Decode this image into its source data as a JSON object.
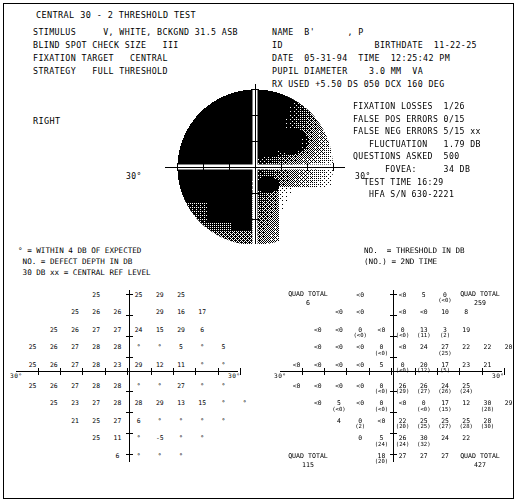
{
  "header": {
    "title": "CENTRAL 30 - 2 THRESHOLD TEST",
    "left_rows": [
      "STIMULUS     V, WHITE, BCKGND 31.5 ASB",
      "BLIND SPOT CHECK SIZE   III",
      "FIXATION TARGET   CENTRAL",
      "STRATEGY   FULL THRESHOLD"
    ],
    "right_rows": [
      "NAME  B'      , P",
      "ID                 BIRTHDATE  11-22-25",
      "DATE  05-31-94  TIME  12:25:42 PM",
      "PUPIL DIAMETER    3.0 MM  VA",
      "RX USED +5.50 DS 050 DCX 160 DEG"
    ]
  },
  "eye_label": "RIGHT",
  "reliability": [
    "FIXATION LOSSES  1/26",
    "FALSE POS ERRORS 0/15",
    "FALSE NEG ERRORS 5/15 xx",
    "   FLUCTUATION   1.79 DB",
    "QUESTIONS ASKED  500",
    "      FOVEA:     34 DB",
    "  TEST TIME 16:29",
    "   HFA S/N 630-2221"
  ],
  "map": {
    "left_deg_label": "30°",
    "right_deg_label": "30°"
  },
  "legend": {
    "left": "° = WITHIN 4 DB OF EXPECTED\n NO. = DEFECT DEPTH IN DB\n 30 DB xx = CENTRAL REF LEVEL",
    "right": "NO.  = THRESHOLD IN DB\n(NO.) = 2ND TIME"
  },
  "defect_grid": {
    "deg_left": "30°",
    "deg_right": "30°",
    "quad_totals": {
      "top_left_label": "QUAD TOTAL",
      "top_left_value": "",
      "top_right_label": "",
      "top_right_value": "",
      "bottom_left_label": "",
      "bottom_left_value": "",
      "bottom_right_label": "",
      "bottom_right_value": ""
    },
    "rows": [
      {
        "y": 0,
        "cells": [
          {
            "x": 3,
            "v": "25"
          },
          {
            "x": 5,
            "v": "25"
          },
          {
            "x": 6,
            "v": "29"
          },
          {
            "x": 7,
            "v": "25"
          }
        ]
      },
      {
        "y": 1,
        "cells": [
          {
            "x": 2,
            "v": "25"
          },
          {
            "x": 3,
            "v": "26"
          },
          {
            "x": 4,
            "v": "26"
          },
          {
            "x": 6,
            "v": "29"
          },
          {
            "x": 7,
            "v": "16"
          },
          {
            "x": 8,
            "v": "17"
          }
        ]
      },
      {
        "y": 2,
        "cells": [
          {
            "x": 1,
            "v": "25"
          },
          {
            "x": 2,
            "v": "26"
          },
          {
            "x": 3,
            "v": "27"
          },
          {
            "x": 4,
            "v": "27"
          },
          {
            "x": 5,
            "v": "24"
          },
          {
            "x": 6,
            "v": "15"
          },
          {
            "x": 7,
            "v": "29"
          },
          {
            "x": 8,
            "v": "6"
          }
        ]
      },
      {
        "y": 3,
        "cells": [
          {
            "x": 0,
            "v": "25"
          },
          {
            "x": 1,
            "v": "26"
          },
          {
            "x": 2,
            "v": "27"
          },
          {
            "x": 3,
            "v": "28"
          },
          {
            "x": 4,
            "v": "28"
          },
          {
            "x": 5,
            "v": "°"
          },
          {
            "x": 6,
            "v": "°"
          },
          {
            "x": 7,
            "v": "5"
          },
          {
            "x": 8,
            "v": "°"
          },
          {
            "x": 9,
            "v": "5"
          }
        ]
      },
      {
        "y": 4,
        "cells": [
          {
            "x": 0,
            "v": "25"
          },
          {
            "x": 1,
            "v": "26"
          },
          {
            "x": 2,
            "v": "27"
          },
          {
            "x": 3,
            "v": "28"
          },
          {
            "x": 4,
            "v": "23"
          },
          {
            "x": 5,
            "v": "29"
          },
          {
            "x": 6,
            "v": "12"
          },
          {
            "x": 7,
            "v": "11"
          },
          {
            "x": 8,
            "v": "°"
          },
          {
            "x": 9,
            "v": "°"
          }
        ]
      },
      {
        "y": 5,
        "cells": [
          {
            "x": 0,
            "v": "25"
          },
          {
            "x": 1,
            "v": "26"
          },
          {
            "x": 2,
            "v": "27"
          },
          {
            "x": 3,
            "v": "28"
          },
          {
            "x": 4,
            "v": "28"
          },
          {
            "x": 5,
            "v": "°"
          },
          {
            "x": 6,
            "v": "°"
          },
          {
            "x": 7,
            "v": "27"
          },
          {
            "x": 8,
            "v": "°"
          },
          {
            "x": 9,
            "v": "°"
          }
        ]
      },
      {
        "y": 6,
        "cells": [
          {
            "x": 1,
            "v": "25"
          },
          {
            "x": 2,
            "v": "23"
          },
          {
            "x": 3,
            "v": "27"
          },
          {
            "x": 4,
            "v": "28"
          },
          {
            "x": 5,
            "v": "28"
          },
          {
            "x": 6,
            "v": "29"
          },
          {
            "x": 7,
            "v": "13"
          },
          {
            "x": 8,
            "v": "15"
          },
          {
            "x": 9,
            "v": "°"
          },
          {
            "x": 10,
            "v": "°"
          }
        ]
      },
      {
        "y": 7,
        "cells": [
          {
            "x": 2,
            "v": "21"
          },
          {
            "x": 3,
            "v": "25"
          },
          {
            "x": 4,
            "v": "27"
          },
          {
            "x": 5,
            "v": "6"
          },
          {
            "x": 6,
            "v": "°"
          },
          {
            "x": 7,
            "v": "°"
          },
          {
            "x": 8,
            "v": "°"
          },
          {
            "x": 9,
            "v": "°"
          }
        ]
      },
      {
        "y": 8,
        "cells": [
          {
            "x": 3,
            "v": "25"
          },
          {
            "x": 4,
            "v": "11"
          },
          {
            "x": 5,
            "v": "°"
          },
          {
            "x": 6,
            "v": "-5"
          },
          {
            "x": 7,
            "v": "°"
          },
          {
            "x": 8,
            "v": "°"
          }
        ]
      },
      {
        "y": 9,
        "cells": [
          {
            "x": 4,
            "v": "6"
          },
          {
            "x": 5,
            "v": "°"
          },
          {
            "x": 6,
            "v": "°"
          },
          {
            "x": 7,
            "v": "°"
          }
        ]
      }
    ]
  },
  "threshold_grid": {
    "deg_left": "30°",
    "deg_right": "30°",
    "quad_totals": {
      "top_left_label": "QUAD TOTAL",
      "top_left_value": "6",
      "top_right_label": "QUAD TOTAL",
      "top_right_value": "259",
      "bottom_left_label": "QUAD TOTAL",
      "bottom_left_value": "115",
      "bottom_right_label": "QUAD TOTAL",
      "bottom_right_value": "427"
    },
    "rows": [
      {
        "y": 0,
        "cells": [
          {
            "x": 3,
            "v": "<0"
          },
          {
            "x": 5,
            "v": "<0"
          },
          {
            "x": 6,
            "v": "5"
          },
          {
            "x": 7,
            "v": "0",
            "p": "(<0)"
          }
        ]
      },
      {
        "y": 1,
        "cells": [
          {
            "x": 2,
            "v": "<0"
          },
          {
            "x": 3,
            "v": "<0"
          },
          {
            "x": 5,
            "v": "<0"
          },
          {
            "x": 6,
            "v": "<0"
          },
          {
            "x": 7,
            "v": "10"
          },
          {
            "x": 8,
            "v": "8"
          }
        ]
      },
      {
        "y": 2,
        "cells": [
          {
            "x": 1,
            "v": "<0"
          },
          {
            "x": 2,
            "v": "<0"
          },
          {
            "x": 3,
            "v": "0",
            "p": "(<0)"
          },
          {
            "x": 4,
            "v": "<0"
          },
          {
            "x": 5,
            "v": "0",
            "p": "(<0)"
          },
          {
            "x": 6,
            "v": "13",
            "p": "(11)"
          },
          {
            "x": 7,
            "v": "3",
            "p": "(2)"
          },
          {
            "x": 8,
            "v": "19"
          }
        ]
      },
      {
        "y": 3,
        "cells": [
          {
            "x": 1,
            "v": "<0"
          },
          {
            "x": 2,
            "v": "<0"
          },
          {
            "x": 3,
            "v": "<0"
          },
          {
            "x": 4,
            "v": "0",
            "p": "(<0)"
          },
          {
            "x": 5,
            "v": "<0"
          },
          {
            "x": 6,
            "v": "24"
          },
          {
            "x": 7,
            "v": "27",
            "p": "(25)"
          },
          {
            "x": 8,
            "v": "22"
          },
          {
            "x": 9,
            "v": "22"
          },
          {
            "x": 10,
            "v": "20"
          }
        ]
      },
      {
        "y": 4,
        "cells": [
          {
            "x": 0,
            "v": "<0"
          },
          {
            "x": 1,
            "v": "<0"
          },
          {
            "x": 2,
            "v": "<0"
          },
          {
            "x": 3,
            "v": "<0"
          },
          {
            "x": 4,
            "v": "5"
          },
          {
            "x": 5,
            "v": "0",
            "p": "(<0)"
          },
          {
            "x": 6,
            "v": "20",
            "p": "(12)"
          },
          {
            "x": 7,
            "v": "17",
            "p": "(5)"
          },
          {
            "x": 8,
            "v": "23"
          },
          {
            "x": 9,
            "v": "21"
          }
        ]
      },
      {
        "y": 5,
        "cells": [
          {
            "x": 0,
            "v": "<0"
          },
          {
            "x": 1,
            "v": "<0"
          },
          {
            "x": 2,
            "v": "<0"
          },
          {
            "x": 3,
            "v": "<0"
          },
          {
            "x": 4,
            "v": "0",
            "p": "(<0)"
          },
          {
            "x": 5,
            "v": "26",
            "p": "(29)"
          },
          {
            "x": 6,
            "v": "26",
            "p": "(27)"
          },
          {
            "x": 7,
            "v": "24",
            "p": "(26)"
          },
          {
            "x": 8,
            "v": "25",
            "p": "(24)"
          }
        ]
      },
      {
        "y": 6,
        "cells": [
          {
            "x": 1,
            "v": "<0"
          },
          {
            "x": 2,
            "v": "5",
            "p": "(<0)"
          },
          {
            "x": 3,
            "v": "<0"
          },
          {
            "x": 4,
            "v": "0",
            "p": "(<0)"
          },
          {
            "x": 5,
            "v": "<0"
          },
          {
            "x": 6,
            "v": "0",
            "p": "(<0)"
          },
          {
            "x": 7,
            "v": "17",
            "p": "(15)"
          },
          {
            "x": 8,
            "v": "12"
          },
          {
            "x": 9,
            "v": "30",
            "p": "(28)"
          },
          {
            "x": 10,
            "v": "29"
          }
        ]
      },
      {
        "y": 7,
        "cells": [
          {
            "x": 2,
            "v": "4"
          },
          {
            "x": 3,
            "v": "0",
            "p": "(2)"
          },
          {
            "x": 4,
            "v": "<0"
          },
          {
            "x": 5,
            "v": "22",
            "p": "(20)"
          },
          {
            "x": 6,
            "v": "25",
            "p": "(25)"
          },
          {
            "x": 7,
            "v": "25",
            "p": "(27)"
          },
          {
            "x": 8,
            "v": "25",
            "p": "(28)"
          },
          {
            "x": 9,
            "v": "28",
            "p": "(30)"
          }
        ]
      },
      {
        "y": 8,
        "cells": [
          {
            "x": 3,
            "v": "0"
          },
          {
            "x": 4,
            "v": "5",
            "p": "(24)"
          },
          {
            "x": 5,
            "v": "26",
            "p": "(24)"
          },
          {
            "x": 6,
            "v": "30",
            "p": "(32)"
          },
          {
            "x": 7,
            "v": "24"
          },
          {
            "x": 8,
            "v": "22"
          }
        ]
      },
      {
        "y": 9,
        "cells": [
          {
            "x": 4,
            "v": "18",
            "p": "(20)"
          },
          {
            "x": 5,
            "v": "27"
          },
          {
            "x": 6,
            "v": "27"
          },
          {
            "x": 7,
            "v": "27"
          }
        ]
      }
    ]
  }
}
